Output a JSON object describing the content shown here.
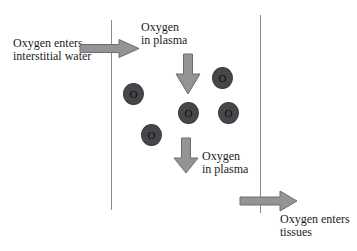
{
  "diagram": {
    "labels": {
      "interstitial": {
        "line1": "Oxygen enters",
        "line2": "interstitial water"
      },
      "plasma_top": {
        "line1": "Oxygen",
        "line2": "in plasma"
      },
      "plasma_bottom": {
        "line1": "Oxygen",
        "line2": "in plasma"
      },
      "tissues": {
        "line1": "Oxygen enters",
        "line2": "tissues"
      }
    },
    "cells": [
      {
        "label": "O"
      },
      {
        "label": "O"
      },
      {
        "label": "O"
      },
      {
        "label": "O"
      },
      {
        "label": "O"
      }
    ]
  },
  "colors": {
    "background": "#ffffff",
    "text": "#1b1b1b",
    "line": "#8a8a8a",
    "arrow-fill": "#949494",
    "arrow-stroke": "#6e6e6e",
    "cell-fill": "#47474b",
    "cell-stroke": "#3a3a3e",
    "cell-text": "#0d0d0d"
  }
}
